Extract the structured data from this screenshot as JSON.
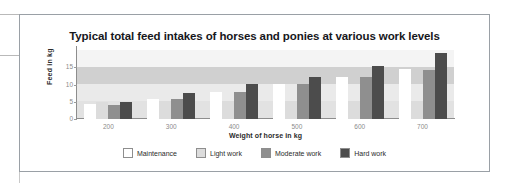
{
  "figure": {
    "title": "Typical total feed intakes of horses and ponies at various work levels"
  },
  "chart_data": {
    "type": "bar",
    "title": "Typical total feed intakes of horses and ponies at various work levels",
    "xlabel": "Weight of horse in kg",
    "ylabel": "Feed  in kg",
    "categories": [
      "200",
      "300",
      "400",
      "500",
      "600",
      "700"
    ],
    "ylim": [
      0,
      20
    ],
    "yticks": [
      "0",
      "5",
      "10",
      "15"
    ],
    "ytick_values": [
      0,
      5,
      10,
      15
    ],
    "grid": false,
    "legend_position": "bottom",
    "series": [
      {
        "name": "Maintenance",
        "color": "#ffffff",
        "values": [
          4.3,
          5.9,
          7.9,
          10.2,
          12.2,
          14.5
        ]
      },
      {
        "name": "Light work",
        "color": "#dcdcdc",
        "values": [
          5.0,
          5.2,
          5.2,
          5.2,
          5.2,
          5.3
        ]
      },
      {
        "name": "Moderate work",
        "color": "#8f8f8f",
        "values": [
          4.0,
          5.9,
          7.8,
          10.1,
          12.2,
          14.3
        ]
      },
      {
        "name": "Hard work",
        "color": "#4c4c4c",
        "values": [
          5.0,
          7.4,
          10.1,
          12.3,
          15.3,
          19.0
        ]
      }
    ]
  }
}
